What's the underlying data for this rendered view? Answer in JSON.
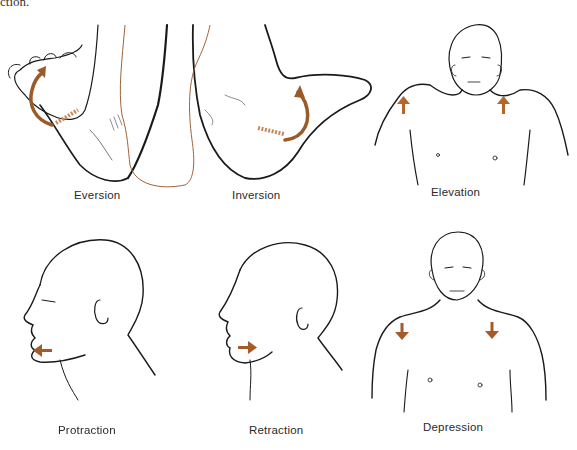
{
  "header": {
    "cut_text": "ction."
  },
  "colors": {
    "line": "#1a1a1a",
    "accent": "#9a5a2a",
    "leg_outline": "#a0633a",
    "background": "#ffffff"
  },
  "panels": [
    {
      "id": "eversion",
      "label": "Eversion",
      "arrow": "curved-arrow-up-left"
    },
    {
      "id": "inversion",
      "label": "Inversion",
      "arrow": "curved-arrow-up-right"
    },
    {
      "id": "elevation",
      "label": "Elevation",
      "arrow": "arrows-up"
    },
    {
      "id": "protraction",
      "label": "Protraction",
      "arrow": "arrow-left"
    },
    {
      "id": "retraction",
      "label": "Retraction",
      "arrow": "arrow-right"
    },
    {
      "id": "depression",
      "label": "Depression",
      "arrow": "arrows-down"
    }
  ]
}
